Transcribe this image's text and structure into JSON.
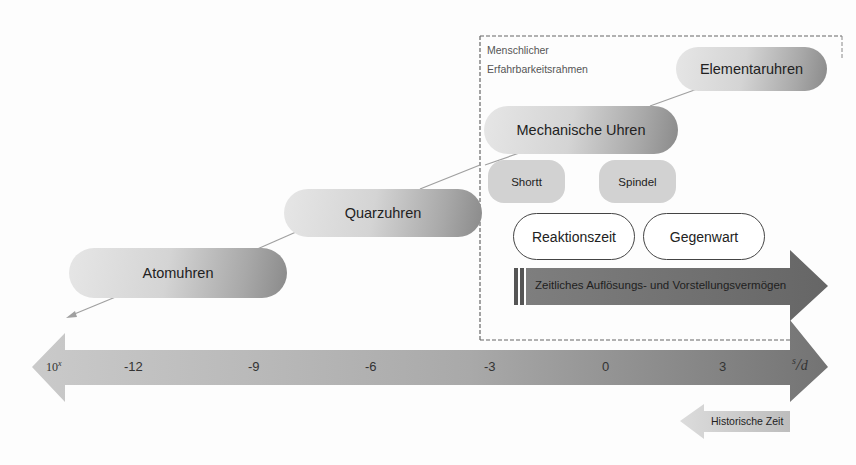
{
  "frame": {
    "label_line1": "Menschlicher",
    "label_line2": "Erfahrbarkeitsrahmen"
  },
  "clocks": {
    "elementaruhren": "Elementaruhren",
    "mechanische_uhren": "Mechanische Uhren",
    "shortt": "Shortt",
    "spindel": "Spindel",
    "quarzuhren": "Quarzuhren",
    "atomuhren": "Atomuhren"
  },
  "human": {
    "reaktionszeit": "Reaktionszeit",
    "gegenwart": "Gegenwart",
    "resolution_arrow": "Zeitliches Auflösungs- und Vorstellungsvermögen"
  },
  "timeline": {
    "base_label": "10",
    "base_exponent": "x",
    "ticks": [
      "-12",
      "-9",
      "-6",
      "-3",
      "0",
      "3"
    ],
    "unit_label": "s",
    "unit_denominator": "d"
  },
  "historical": {
    "label": "Historische Zeit"
  },
  "colors": {
    "timeline_left": "#c4c4c4",
    "timeline_right": "#7a7a7a",
    "resolution_arrow": "#6e6e6e",
    "pill_light": "#e6e6e6",
    "pill_dark": "#8a8a8a",
    "frame_dash": "#666666"
  }
}
